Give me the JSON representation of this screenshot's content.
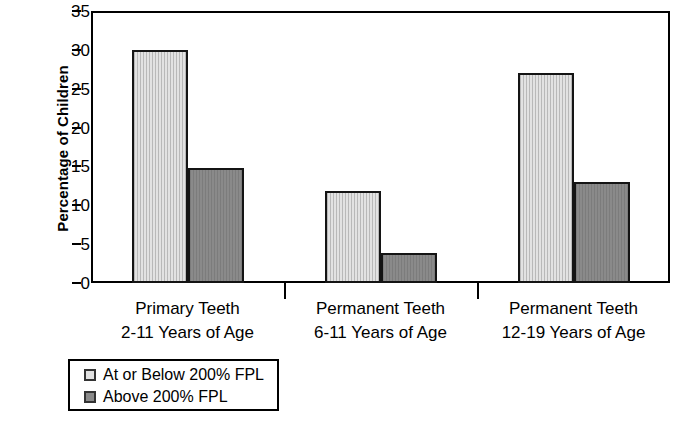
{
  "chart_data": {
    "type": "bar",
    "title": "",
    "xlabel": "",
    "ylabel": "Percentage of Children",
    "ylim": [
      0,
      35
    ],
    "yticks": [
      0,
      5,
      10,
      15,
      20,
      25,
      30,
      35
    ],
    "grid": false,
    "legend_position": "below-left",
    "categories": [
      "Primary Teeth 2-11 Years of Age",
      "Permanent Teeth 6-11 Years of Age",
      "Permanent Teeth 12-19 Years of Age"
    ],
    "category_lines": [
      {
        "line1": "Primary Teeth",
        "line2": "2-11 Years of Age"
      },
      {
        "line1": "Permanent Teeth",
        "line2": "6-11 Years of Age"
      },
      {
        "line1": "Permanent Teeth",
        "line2": "12-19 Years of Age"
      }
    ],
    "series": [
      {
        "name": "At or Below 200% FPL",
        "color": "#e2e2e2",
        "values": [
          30.0,
          11.8,
          27.0
        ]
      },
      {
        "name": "Above 200% FPL",
        "color": "#8a8a8a",
        "values": [
          14.8,
          3.8,
          13.0
        ]
      }
    ]
  },
  "axis": {
    "y_title": "Percentage of Children",
    "y_tick_labels": [
      "0",
      "5",
      "10",
      "15",
      "20",
      "25",
      "30",
      "35"
    ]
  },
  "legend": {
    "items": [
      {
        "label": "At or Below 200% FPL",
        "swatch": "light"
      },
      {
        "label": "Above 200% FPL",
        "swatch": "dark"
      }
    ]
  }
}
